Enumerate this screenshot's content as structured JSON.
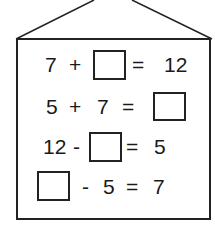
{
  "worksheet": {
    "equations": [
      {
        "parts": [
          "7",
          "+",
          "□",
          "=",
          "12"
        ],
        "a": "7",
        "op": "+",
        "eq": "=",
        "result": "12"
      },
      {
        "parts": [
          "5",
          "+",
          "7",
          "=",
          "□"
        ],
        "a": "5",
        "op": "+",
        "b": "7",
        "eq": "="
      },
      {
        "parts": [
          "12",
          "-",
          "□",
          "=",
          "5"
        ],
        "a": "12",
        "op": "-",
        "eq": "=",
        "result": "5"
      },
      {
        "parts": [
          "□",
          "-",
          "5",
          "=",
          "7"
        ],
        "op": "-",
        "b": "5",
        "eq": "=",
        "result": "7"
      }
    ]
  }
}
